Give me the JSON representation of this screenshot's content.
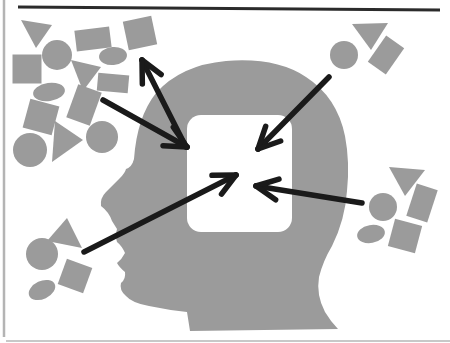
{
  "canvas": {
    "width": 450,
    "height": 343,
    "background": "#ffffff"
  },
  "colors": {
    "shape_gray": "#9b9b9b",
    "arrow_black": "#1a1a1a",
    "window_white": "#ffffff",
    "frame_top": "#2b2b2b",
    "frame_left": "#b4b4b4",
    "frame_bottom": "#c8c8c8"
  },
  "frame": {
    "top_line": {
      "x1": 18,
      "y1": 7,
      "x2": 440,
      "y2": 10,
      "width": 3
    },
    "left_line": {
      "x1": 4,
      "y1": 0,
      "x2": 4,
      "y2": 337,
      "width": 2.5
    },
    "bottom_line": {
      "x1": 6,
      "y1": 341,
      "x2": 450,
      "y2": 341,
      "width": 2
    }
  },
  "head": {
    "path": "M 101,206 Q 100,198 106,192 L 120,178 Q 125,173 126,169 Q 132,167 134,159 Q 137,117 156,93 Q 181,65 226,61 Q 276,57 306,77 Q 337,97 345,136 Q 350,162 347,191 Q 345,220 332,246 Q 323,261 319,277 Q 316,295 325,312 Q 331,322 338,329 L 190,331 L 187,312 Q 168,310 149,306 Q 132,303 126,296 Q 119,290 121,283 Q 126,279 125,272 Q 119,267 117,263 Q 122,259 125,253 Q 122,246 117,242 Q 115,236 117,229 L 112,221 Q 109,212 101,206 Z",
    "window": {
      "x": 187,
      "y": 115,
      "width": 105,
      "height": 117,
      "radius": 14
    }
  },
  "clusters": {
    "top_left": [
      {
        "type": "triangle",
        "points": [
          [
            21,
            20
          ],
          [
            52,
            25
          ],
          [
            36,
            48
          ]
        ]
      },
      {
        "type": "rect",
        "cx": 93,
        "cy": 39,
        "w": 35,
        "h": 21,
        "rotate": -7
      },
      {
        "type": "rect",
        "cx": 140,
        "cy": 33,
        "w": 29,
        "h": 29,
        "rotate": -12
      },
      {
        "type": "circle",
        "cx": 57,
        "cy": 55,
        "r": 15
      },
      {
        "type": "rect",
        "cx": 27,
        "cy": 69,
        "w": 29,
        "h": 29,
        "rotate": 0
      },
      {
        "type": "triangle",
        "points": [
          [
            71,
            60
          ],
          [
            101,
            67
          ],
          [
            83,
            91
          ]
        ]
      },
      {
        "type": "ellipse",
        "cx": 113,
        "cy": 56,
        "rx": 14,
        "ry": 9,
        "rotate": -5
      },
      {
        "type": "rect",
        "cx": 113,
        "cy": 83,
        "w": 31,
        "h": 18,
        "rotate": 5
      },
      {
        "type": "ellipse",
        "cx": 49,
        "cy": 92,
        "rx": 16,
        "ry": 9,
        "rotate": -8
      },
      {
        "type": "rect",
        "cx": 41,
        "cy": 117,
        "w": 30,
        "h": 30,
        "rotate": 15
      },
      {
        "type": "rect",
        "cx": 84,
        "cy": 105,
        "w": 25,
        "h": 35,
        "rotate": 20
      },
      {
        "type": "triangle",
        "points": [
          [
            55,
            121
          ],
          [
            83,
            140
          ],
          [
            52,
            162
          ]
        ]
      },
      {
        "type": "circle",
        "cx": 30,
        "cy": 150,
        "r": 17
      },
      {
        "type": "circle",
        "cx": 102,
        "cy": 137,
        "r": 16
      }
    ],
    "top_right": [
      {
        "type": "circle",
        "cx": 344,
        "cy": 55,
        "r": 14
      },
      {
        "type": "triangle",
        "points": [
          [
            352,
            24
          ],
          [
            388,
            23
          ],
          [
            371,
            50
          ]
        ]
      },
      {
        "type": "rect",
        "cx": 386,
        "cy": 55,
        "w": 22,
        "h": 32,
        "rotate": 35
      }
    ],
    "right": [
      {
        "type": "triangle",
        "points": [
          [
            389,
            167
          ],
          [
            425,
            170
          ],
          [
            405,
            196
          ]
        ]
      },
      {
        "type": "rect",
        "cx": 422,
        "cy": 203,
        "w": 22,
        "h": 34,
        "rotate": 18
      },
      {
        "type": "circle",
        "cx": 383,
        "cy": 207,
        "r": 14
      },
      {
        "type": "ellipse",
        "cx": 371,
        "cy": 234,
        "rx": 14,
        "ry": 9,
        "rotate": -10
      },
      {
        "type": "rect",
        "cx": 405,
        "cy": 236,
        "w": 28,
        "h": 28,
        "rotate": 15
      }
    ],
    "bottom_left": [
      {
        "type": "triangle",
        "points": [
          [
            67,
            218
          ],
          [
            47,
            241
          ],
          [
            82,
            248
          ]
        ]
      },
      {
        "type": "circle",
        "cx": 42,
        "cy": 254,
        "r": 16
      },
      {
        "type": "rect",
        "cx": 75,
        "cy": 276,
        "w": 27,
        "h": 27,
        "rotate": 20
      },
      {
        "type": "ellipse",
        "cx": 42,
        "cy": 290,
        "rx": 14,
        "ry": 9,
        "rotate": -25
      }
    ]
  },
  "arrow_style": {
    "stroke_width": 5.5,
    "barb_length": 24,
    "barb_angle_deg": 26
  },
  "arrows": [
    {
      "name": "arrow-out-to-top-left-cluster",
      "tail": [
        186,
        147
      ],
      "tip": [
        142,
        60
      ]
    },
    {
      "name": "arrow-in-from-top-left-cluster",
      "tail": [
        103,
        100
      ],
      "tip": [
        187,
        147
      ]
    },
    {
      "name": "arrow-in-from-top-right-cluster",
      "tail": [
        329,
        77
      ],
      "tip": [
        258,
        149
      ]
    },
    {
      "name": "arrow-in-from-right-cluster",
      "tail": [
        362,
        203
      ],
      "tip": [
        256,
        186
      ]
    },
    {
      "name": "arrow-in-from-bottom-left-cluster",
      "tail": [
        84,
        252
      ],
      "tip": [
        236,
        175
      ]
    }
  ]
}
